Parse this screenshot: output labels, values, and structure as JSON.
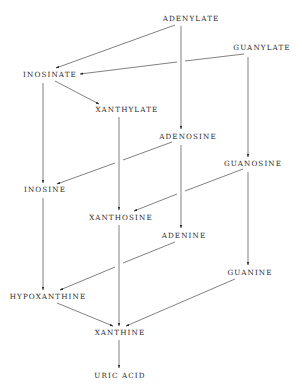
{
  "diagram": {
    "type": "pathway",
    "title": "",
    "nodes": [
      {
        "id": "adenylate",
        "label": "ADENYLATE",
        "x": 191,
        "y": 21
      },
      {
        "id": "guanylate",
        "label": "GUANYLATE",
        "x": 262,
        "y": 50
      },
      {
        "id": "inosinate",
        "label": "INOSINATE",
        "x": 50,
        "y": 77
      },
      {
        "id": "xanthylate",
        "label": "XANTHYLATE",
        "x": 127,
        "y": 112
      },
      {
        "id": "adenosine",
        "label": "ADENOSINE",
        "x": 188,
        "y": 139
      },
      {
        "id": "guanosine",
        "label": "GUANOSINE",
        "x": 253,
        "y": 166
      },
      {
        "id": "inosine",
        "label": "INOSINE",
        "x": 45,
        "y": 192
      },
      {
        "id": "xanthosine",
        "label": "XANTHOSINE",
        "x": 121,
        "y": 220
      },
      {
        "id": "adenine",
        "label": "ADENINE",
        "x": 184,
        "y": 238
      },
      {
        "id": "guanine",
        "label": "GUANINE",
        "x": 250,
        "y": 275
      },
      {
        "id": "hypoxanthine",
        "label": "HYPOXANTHINE",
        "x": 48,
        "y": 299
      },
      {
        "id": "xanthine",
        "label": "XANTHINE",
        "x": 120,
        "y": 335
      },
      {
        "id": "uric_acid",
        "label": "URIC ACID",
        "x": 120,
        "y": 378
      }
    ],
    "edges": [
      {
        "from": "adenylate",
        "to": "inosinate"
      },
      {
        "from": "guanylate",
        "to": "inosinate"
      },
      {
        "from": "adenylate",
        "to": "adenosine"
      },
      {
        "from": "guanylate",
        "to": "guanosine"
      },
      {
        "from": "inosinate",
        "to": "xanthylate"
      },
      {
        "from": "inosinate",
        "to": "inosine"
      },
      {
        "from": "xanthylate",
        "to": "xanthosine"
      },
      {
        "from": "adenosine",
        "to": "inosine"
      },
      {
        "from": "adenosine",
        "to": "adenine"
      },
      {
        "from": "guanosine",
        "to": "xanthosine"
      },
      {
        "from": "guanosine",
        "to": "guanine"
      },
      {
        "from": "inosine",
        "to": "hypoxanthine"
      },
      {
        "from": "adenine",
        "to": "hypoxanthine"
      },
      {
        "from": "xanthosine",
        "to": "xanthine"
      },
      {
        "from": "hypoxanthine",
        "to": "xanthine"
      },
      {
        "from": "guanine",
        "to": "xanthine"
      },
      {
        "from": "xanthine",
        "to": "uric_acid"
      }
    ]
  }
}
